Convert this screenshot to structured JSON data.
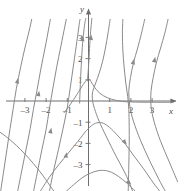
{
  "figure": {
    "title": "",
    "background_color": "#ffffff",
    "curve_color": "#8a8a8a",
    "axis_color": "#6e6e6e",
    "label_color": "#4a4a4a"
  },
  "chart_data": {
    "type": "line",
    "title": "",
    "subtitle": "",
    "xlabel": "x",
    "ylabel": "y",
    "xlim": [
      -4.2,
      4.4
    ],
    "ylim": [
      -4.3,
      3.9
    ],
    "grid": false,
    "legend": null,
    "axes": {
      "x_axis_label": "x",
      "y_axis_label": "y",
      "x_ticks": [
        -3,
        -2,
        -1,
        1,
        2,
        3
      ],
      "x_tick_labels": [
        "-3",
        "-2",
        "-1",
        "1",
        "2",
        "3"
      ],
      "y_ticks": [
        -3,
        -2,
        -1,
        1,
        2,
        3
      ],
      "y_tick_labels": [
        "-3",
        "-2",
        "-1",
        "1",
        "2",
        "3"
      ],
      "x_arrow": true,
      "y_arrow": true,
      "origin": [
        0,
        0
      ]
    },
    "annotations": [],
    "series": [
      {
        "name": "curve-far-left-rising",
        "style": "solid",
        "arrow": "up",
        "arrow_at": [
          -3.35,
          0.95
        ],
        "points": [
          [
            -4.15,
            -4.3
          ],
          [
            -4.0,
            -3.3
          ],
          [
            -3.85,
            -2.3
          ],
          [
            -3.7,
            -1.3
          ],
          [
            -3.55,
            -0.35
          ],
          [
            -3.4,
            0.6
          ],
          [
            -3.2,
            1.6
          ],
          [
            -3.0,
            2.5
          ],
          [
            -2.8,
            3.3
          ],
          [
            -2.68,
            3.85
          ]
        ]
      },
      {
        "name": "curve-left-rising-2",
        "style": "solid",
        "arrow": "up",
        "arrow_at": [
          -2.35,
          0.35
        ],
        "points": [
          [
            -3.35,
            -4.3
          ],
          [
            -3.15,
            -3.3
          ],
          [
            -2.95,
            -2.3
          ],
          [
            -2.75,
            -1.3
          ],
          [
            -2.6,
            -0.4
          ],
          [
            -2.42,
            0.55
          ],
          [
            -2.25,
            1.5
          ],
          [
            -2.05,
            2.5
          ],
          [
            -1.88,
            3.4
          ],
          [
            -1.8,
            3.85
          ]
        ]
      },
      {
        "name": "curve-left-rising-3",
        "style": "solid",
        "arrow": "up",
        "arrow_at": [
          -1.78,
          -1.4
        ],
        "points": [
          [
            -2.6,
            -4.3
          ],
          [
            -2.4,
            -3.3
          ],
          [
            -2.2,
            -2.3
          ],
          [
            -2.0,
            -1.35
          ],
          [
            -1.85,
            -0.4
          ],
          [
            -1.68,
            0.6
          ],
          [
            -1.5,
            1.6
          ],
          [
            -1.3,
            2.6
          ],
          [
            -1.12,
            3.5
          ],
          [
            -1.05,
            3.85
          ]
        ]
      },
      {
        "name": "curve-left-rising-4",
        "style": "solid",
        "arrow": "up",
        "arrow_at": [
          -1.05,
          -2.55
        ],
        "points": [
          [
            -1.85,
            -4.3
          ],
          [
            -1.65,
            -3.3
          ],
          [
            -1.42,
            -2.3
          ],
          [
            -1.2,
            -1.3
          ],
          [
            -1.0,
            -0.3
          ],
          [
            -0.85,
            0.7
          ],
          [
            -0.7,
            1.75
          ],
          [
            -0.55,
            2.8
          ],
          [
            -0.44,
            3.6
          ],
          [
            -0.4,
            3.85
          ]
        ]
      },
      {
        "name": "curve-asymptote-left-of-axis",
        "style": "solid",
        "arrow": "up",
        "arrow_at": [
          -0.28,
          2.95
        ],
        "points": [
          [
            -0.42,
            -0.1
          ],
          [
            -0.38,
            0.9
          ],
          [
            -0.33,
            1.9
          ],
          [
            -0.28,
            2.7
          ],
          [
            -0.22,
            3.3
          ],
          [
            -0.16,
            3.75
          ],
          [
            -0.12,
            3.9
          ]
        ]
      },
      {
        "name": "curve-cusp-through-one",
        "style": "solid",
        "arrow": "none",
        "points": [
          [
            -1.15,
            -0.55
          ],
          [
            -0.85,
            -0.15
          ],
          [
            -0.55,
            0.3
          ],
          [
            -0.3,
            0.7
          ],
          [
            -0.12,
            0.95
          ],
          [
            -0.02,
            1.05
          ],
          [
            0.05,
            1.02
          ],
          [
            0.2,
            0.78
          ],
          [
            0.4,
            0.5
          ],
          [
            0.7,
            0.25
          ],
          [
            1.1,
            0.08
          ],
          [
            1.6,
            -0.02
          ],
          [
            2.2,
            -0.05
          ],
          [
            3.0,
            -0.06
          ],
          [
            4.0,
            -0.06
          ]
        ]
      },
      {
        "name": "curve-right-of-axis-up",
        "style": "solid",
        "arrow": "up",
        "arrow_at": [
          0.12,
          3.0
        ],
        "points": [
          [
            -0.05,
            0.95
          ],
          [
            0.0,
            1.6
          ],
          [
            0.04,
            2.3
          ],
          [
            0.08,
            3.0
          ],
          [
            0.12,
            3.5
          ],
          [
            0.16,
            3.9
          ]
        ]
      },
      {
        "name": "curve-u-shape-right",
        "style": "solid",
        "arrow": "none",
        "points": [
          [
            1.02,
            3.85
          ],
          [
            0.92,
            3.2
          ],
          [
            0.8,
            2.5
          ],
          [
            0.66,
            1.85
          ],
          [
            0.5,
            1.3
          ],
          [
            0.34,
            0.85
          ],
          [
            0.2,
            0.45
          ],
          [
            0.18,
            0.1
          ],
          [
            0.28,
            -0.35
          ],
          [
            0.5,
            -0.95
          ],
          [
            0.85,
            -1.7
          ],
          [
            1.3,
            -2.6
          ],
          [
            1.75,
            -3.45
          ],
          [
            2.1,
            -4.3
          ]
        ]
      },
      {
        "name": "curve-vertical-near-two",
        "style": "solid",
        "arrow": "none",
        "points": [
          [
            1.62,
            3.85
          ],
          [
            1.6,
            3.2
          ],
          [
            1.62,
            2.4
          ],
          [
            1.68,
            1.6
          ],
          [
            1.76,
            0.85
          ],
          [
            1.85,
            0.2
          ],
          [
            1.9,
            -0.4
          ],
          [
            1.92,
            -1.2
          ],
          [
            1.92,
            -2.1
          ],
          [
            1.9,
            -3.1
          ],
          [
            1.88,
            -4.0
          ],
          [
            1.87,
            -4.3
          ]
        ]
      },
      {
        "name": "curve-rising-right-1",
        "style": "solid",
        "arrow": "up",
        "arrow_at": [
          2.12,
          1.85
        ],
        "points": [
          [
            2.65,
            3.85
          ],
          [
            2.5,
            3.2
          ],
          [
            2.32,
            2.5
          ],
          [
            2.12,
            1.8
          ],
          [
            1.98,
            1.1
          ],
          [
            1.9,
            0.45
          ],
          [
            1.95,
            -0.25
          ],
          [
            2.12,
            -0.95
          ],
          [
            2.45,
            -1.85
          ],
          [
            2.9,
            -2.85
          ],
          [
            3.4,
            -3.85
          ],
          [
            3.65,
            -4.3
          ]
        ]
      },
      {
        "name": "curve-rising-right-2",
        "style": "solid",
        "arrow": "up",
        "arrow_at": [
          3.12,
          1.95
        ],
        "points": [
          [
            3.75,
            3.85
          ],
          [
            3.6,
            3.2
          ],
          [
            3.4,
            2.5
          ],
          [
            3.2,
            1.8
          ],
          [
            3.05,
            1.1
          ],
          [
            2.95,
            0.45
          ],
          [
            2.95,
            -0.25
          ],
          [
            3.1,
            -1.0
          ],
          [
            3.4,
            -1.9
          ],
          [
            3.8,
            -2.85
          ],
          [
            4.2,
            -3.8
          ]
        ]
      },
      {
        "name": "arc-below-minus-one",
        "style": "solid",
        "arrow": "right",
        "arrow_at": [
          1.72,
          -1.95
        ],
        "points": [
          [
            -2.3,
            -4.3
          ],
          [
            -1.85,
            -3.6
          ],
          [
            -1.4,
            -3.0
          ],
          [
            -0.95,
            -2.45
          ],
          [
            -0.5,
            -1.9
          ],
          [
            -0.1,
            -1.4
          ],
          [
            0.2,
            -1.12
          ],
          [
            0.45,
            -1.02
          ],
          [
            0.7,
            -1.05
          ],
          [
            1.0,
            -1.25
          ],
          [
            1.35,
            -1.6
          ],
          [
            1.75,
            -2.05
          ],
          [
            2.15,
            -2.6
          ],
          [
            2.6,
            -3.2
          ],
          [
            3.05,
            -3.85
          ],
          [
            3.4,
            -4.3
          ]
        ]
      },
      {
        "name": "arc-below-minus-three",
        "style": "solid",
        "arrow": "right",
        "arrow_at": [
          1.92,
          -3.85
        ],
        "points": [
          [
            -1.1,
            -4.3
          ],
          [
            -0.7,
            -3.95
          ],
          [
            -0.3,
            -3.62
          ],
          [
            0.1,
            -3.4
          ],
          [
            0.5,
            -3.28
          ],
          [
            0.9,
            -3.3
          ],
          [
            1.25,
            -3.45
          ],
          [
            1.6,
            -3.7
          ],
          [
            1.95,
            -4.0
          ],
          [
            2.25,
            -4.3
          ]
        ]
      },
      {
        "name": "arc-left-descending",
        "style": "solid",
        "arrow": "none",
        "points": [
          [
            -4.2,
            -1.45
          ],
          [
            -3.8,
            -1.75
          ],
          [
            -3.4,
            -2.1
          ],
          [
            -3.0,
            -2.5
          ],
          [
            -2.6,
            -2.95
          ],
          [
            -2.2,
            -3.45
          ],
          [
            -1.85,
            -3.95
          ],
          [
            -1.6,
            -4.3
          ]
        ]
      }
    ]
  }
}
